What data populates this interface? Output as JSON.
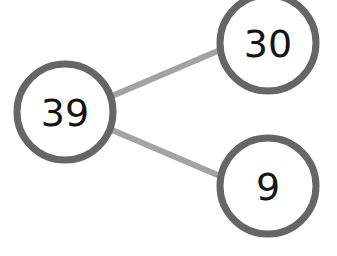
{
  "diagram": {
    "type": "number-bond",
    "whole": {
      "value": "39"
    },
    "parts": [
      {
        "value": "30"
      },
      {
        "value": "9"
      }
    ],
    "colors": {
      "circle_stroke": "#666666",
      "connector": "#a3a3a3",
      "text": "#141414",
      "background": "#ffffff"
    }
  }
}
